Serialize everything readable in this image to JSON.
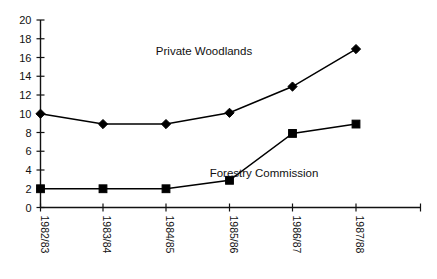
{
  "chart_data": {
    "type": "line",
    "title": "",
    "xlabel": "",
    "ylabel": "",
    "ylim": [
      0,
      20
    ],
    "ytick_step": 2,
    "grid": false,
    "legend_position": "inline-annotation",
    "categories": [
      "1982/83",
      "1983/84",
      "1984/85",
      "1985/86",
      "1986/87",
      "1987/88"
    ],
    "yticks": [
      "0",
      "2",
      "4",
      "6",
      "8",
      "10",
      "12",
      "14",
      "16",
      "18",
      "20"
    ],
    "series": [
      {
        "name": "Private Woodlands",
        "marker": "diamond",
        "color": "#000000",
        "values": [
          10.0,
          8.9,
          8.9,
          10.1,
          12.9,
          16.9
        ]
      },
      {
        "name": "Forestry Commission",
        "marker": "square",
        "color": "#000000",
        "values": [
          2.0,
          2.0,
          2.0,
          2.9,
          7.9,
          8.9
        ]
      }
    ],
    "annotations": [
      {
        "text": "Private Woodlands",
        "x": 204,
        "y": 55
      },
      {
        "text": "Forestry Commission",
        "x": 264,
        "y": 177
      }
    ]
  }
}
